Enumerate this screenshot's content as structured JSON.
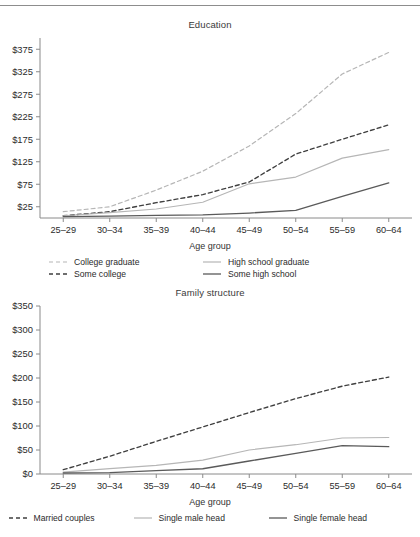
{
  "page": {
    "has_top_rule": true,
    "background": "#ffffff"
  },
  "colors": {
    "light_gray": "#b6b6b6",
    "mid_gray": "#8f8f8f",
    "dark_gray": "#5a5a5a",
    "darkest": "#3f3f3f",
    "axis": "#8a8a8a",
    "text": "#2b2b2b"
  },
  "charts": [
    {
      "id": "education",
      "title": "Education",
      "xlabel": "Age group",
      "legend": [
        {
          "label": "College graduate",
          "style": "dashed",
          "color": "#b6b6b6"
        },
        {
          "label": "High school graduate",
          "style": "solid",
          "color": "#b6b6b6"
        },
        {
          "label": "Some college",
          "style": "dashed",
          "color": "#3f3f3f"
        },
        {
          "label": "Some high school",
          "style": "solid",
          "color": "#5a5a5a"
        }
      ]
    },
    {
      "id": "family",
      "title": "Family structure",
      "xlabel": "Age group",
      "legend": [
        {
          "label": "Married couples",
          "style": "dashed",
          "color": "#3f3f3f"
        },
        {
          "label": "Single male head",
          "style": "solid",
          "color": "#b6b6b6"
        },
        {
          "label": "Single female head",
          "style": "solid",
          "color": "#5a5a5a"
        }
      ]
    }
  ],
  "chart_data": [
    {
      "type": "line",
      "title": "Education",
      "xlabel": "Age group",
      "ylabel": "",
      "categories": [
        "25–29",
        "30–34",
        "35–39",
        "40–44",
        "45–49",
        "50–54",
        "55–59",
        "60–64"
      ],
      "ytick_labels": [
        "$25",
        "$75",
        "$125",
        "$175",
        "$225",
        "$275",
        "$325",
        "$375"
      ],
      "ytick_values": [
        25,
        75,
        125,
        175,
        225,
        275,
        325,
        375
      ],
      "ylim": [
        0,
        400
      ],
      "grid": false,
      "legend_position": "bottom",
      "series": [
        {
          "name": "College graduate",
          "style": "dashed",
          "color": "#b6b6b6",
          "values": [
            14,
            25,
            62,
            104,
            160,
            232,
            320,
            368
          ]
        },
        {
          "name": "Some college",
          "style": "dashed",
          "color": "#3f3f3f",
          "values": [
            5,
            14,
            34,
            52,
            80,
            142,
            175,
            207
          ]
        },
        {
          "name": "High school graduate",
          "style": "solid",
          "color": "#b6b6b6",
          "values": [
            5,
            12,
            20,
            35,
            76,
            91,
            133,
            152
          ]
        },
        {
          "name": "Some high school",
          "style": "solid",
          "color": "#5a5a5a",
          "values": [
            3,
            4,
            6,
            7,
            11,
            17,
            48,
            78
          ]
        }
      ]
    },
    {
      "type": "line",
      "title": "Family structure",
      "xlabel": "Age group",
      "ylabel": "",
      "categories": [
        "25–29",
        "30–34",
        "35–39",
        "40–44",
        "45–49",
        "50–54",
        "55–59",
        "60–64"
      ],
      "ytick_labels": [
        "$0",
        "$50",
        "$100",
        "$150",
        "$200",
        "$250",
        "$300",
        "$350"
      ],
      "ytick_values": [
        0,
        50,
        100,
        150,
        200,
        250,
        300,
        350
      ],
      "ylim": [
        0,
        350
      ],
      "grid": false,
      "legend_position": "bottom",
      "series": [
        {
          "name": "Married couples",
          "style": "dashed",
          "color": "#3f3f3f",
          "values": [
            9,
            37,
            68,
            98,
            128,
            157,
            183,
            202
          ]
        },
        {
          "name": "Single male head",
          "style": "solid",
          "color": "#b6b6b6",
          "values": [
            4,
            11,
            18,
            29,
            50,
            61,
            75,
            76
          ]
        },
        {
          "name": "Single female head",
          "style": "solid",
          "color": "#5a5a5a",
          "values": [
            2,
            3,
            7,
            11,
            27,
            43,
            59,
            57
          ]
        }
      ]
    }
  ]
}
